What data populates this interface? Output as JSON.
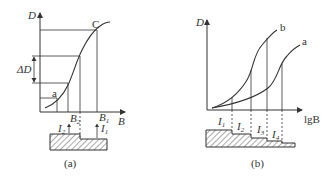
{
  "panel_a": {
    "caption": "(a)",
    "y_axis_label": "D",
    "x_axis_label": "B",
    "curve_point_top": "C",
    "curve_point_bottom": "a",
    "delta_label": "ΔD",
    "b2_label": "B",
    "b2_sub": "2",
    "b1_label": "B",
    "b1_sub": "1",
    "i2_label": "I",
    "i2_sub": "2",
    "i1_label": "I",
    "i1_sub": "1"
  },
  "panel_b": {
    "caption": "(b)",
    "y_axis_label": "D",
    "x_axis_label": "lgB",
    "curve_b_label": "b",
    "curve_a_label": "a",
    "steps": [
      {
        "label": "I",
        "sub": "1"
      },
      {
        "label": "I",
        "sub": "2"
      },
      {
        "label": "I",
        "sub": "3"
      },
      {
        "label": "I",
        "sub": "4"
      }
    ]
  },
  "colors": {
    "line": "#333333",
    "hatch": "#555555"
  }
}
